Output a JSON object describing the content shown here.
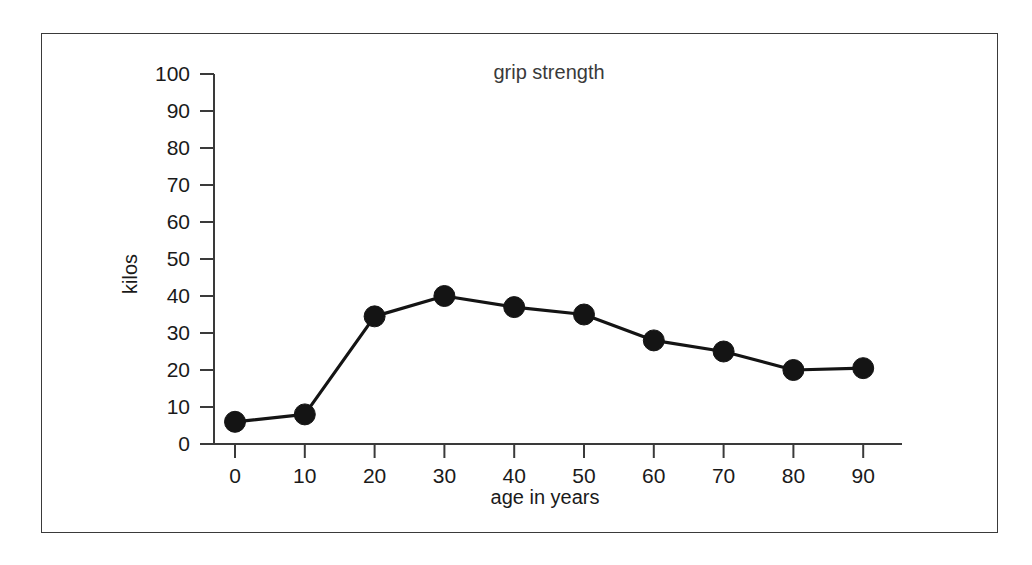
{
  "figure": {
    "background_color": "#ffffff",
    "frame_color": "#3a3a3a",
    "ink_color": "#141414"
  },
  "chart_data": {
    "type": "line",
    "title": "grip strength",
    "xlabel": "age in years",
    "ylabel": "kilos",
    "x": [
      0,
      10,
      20,
      30,
      40,
      50,
      60,
      70,
      80,
      90
    ],
    "values": [
      6,
      8,
      34.5,
      40,
      37,
      35,
      28,
      25,
      20,
      20.5
    ],
    "series": [
      {
        "name": "grip strength",
        "x": [
          0,
          10,
          20,
          30,
          40,
          50,
          60,
          70,
          80,
          90
        ],
        "values": [
          6,
          8,
          34.5,
          40,
          37,
          35,
          28,
          25,
          20,
          20.5
        ],
        "marker": "filled-circle",
        "color": "#141414"
      }
    ],
    "xlim": [
      0,
      90
    ],
    "ylim": [
      0,
      100
    ],
    "xticks": [
      0,
      10,
      20,
      30,
      40,
      50,
      60,
      70,
      80,
      90
    ],
    "yticks": [
      0,
      10,
      20,
      30,
      40,
      50,
      60,
      70,
      80,
      90,
      100
    ],
    "xtick_labels": [
      "0",
      "10",
      "20",
      "30",
      "40",
      "50",
      "60",
      "70",
      "80",
      "90"
    ],
    "ytick_labels": [
      "0",
      "10",
      "20",
      "30",
      "40",
      "50",
      "60",
      "70",
      "80",
      "90",
      "100"
    ],
    "grid": false,
    "legend": false,
    "legend_position": "none"
  }
}
